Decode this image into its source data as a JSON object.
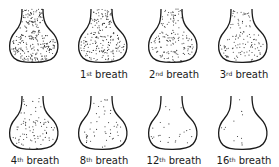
{
  "diagram": {
    "title": "",
    "panels": [
      {
        "id": "initial",
        "label": "",
        "sup": "",
        "suffix": "",
        "dots": 260
      },
      {
        "id": "breath-1",
        "label": "1",
        "sup": "st",
        "suffix": " breath",
        "dots": 200
      },
      {
        "id": "breath-2",
        "label": "2",
        "sup": "nd",
        "suffix": " breath",
        "dots": 150
      },
      {
        "id": "breath-3",
        "label": "3",
        "sup": "rd",
        "suffix": " breath",
        "dots": 115
      },
      {
        "id": "breath-4",
        "label": "4",
        "sup": "th",
        "suffix": " breath",
        "dots": 85
      },
      {
        "id": "breath-8",
        "label": "8",
        "sup": "th",
        "suffix": " breath",
        "dots": 48
      },
      {
        "id": "breath-12",
        "label": "12",
        "sup": "th",
        "suffix": " breath",
        "dots": 24
      },
      {
        "id": "breath-16",
        "label": "16",
        "sup": "th",
        "suffix": " breath",
        "dots": 12
      }
    ],
    "colors": {
      "outline": "#1a1a1a",
      "dots": "#333333",
      "background": "#ffffff"
    }
  }
}
